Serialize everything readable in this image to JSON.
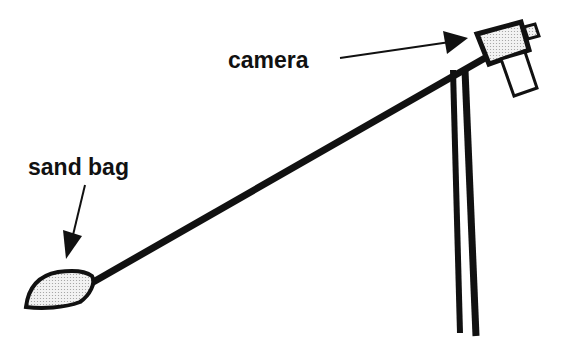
{
  "diagram": {
    "labels": {
      "camera": "camera",
      "sand_bag": "sand bag"
    },
    "colors": {
      "ink": "#111111",
      "fill": "#e6e6e6",
      "background": "#ffffff"
    }
  }
}
